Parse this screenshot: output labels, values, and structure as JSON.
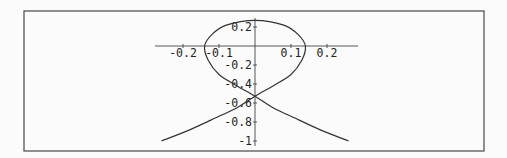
{
  "chart_data": {
    "type": "line",
    "title": "",
    "xlabel": "",
    "ylabel": "",
    "xlim": [
      -0.28,
      0.28
    ],
    "ylim": [
      -1.02,
      0.28
    ],
    "grid": false,
    "legend": null,
    "x_ticks": [
      "-0.2",
      "-0.1",
      "0.1",
      "0.2"
    ],
    "y_ticks": [
      "0.2",
      "-0.2",
      "-0.4",
      "-0.6",
      "-0.8",
      "-1"
    ],
    "series": [
      {
        "name": "curve",
        "points": [
          [
            -0.26,
            -1.0
          ],
          [
            -0.18,
            -0.88
          ],
          [
            -0.1,
            -0.74
          ],
          [
            -0.05,
            -0.65
          ],
          [
            0.0,
            -0.53
          ],
          [
            0.05,
            -0.42
          ],
          [
            0.1,
            -0.3
          ],
          [
            0.13,
            -0.15
          ],
          [
            0.14,
            0.0
          ],
          [
            0.12,
            0.12
          ],
          [
            0.08,
            0.22
          ],
          [
            0.0,
            0.27
          ],
          [
            -0.08,
            0.22
          ],
          [
            -0.12,
            0.12
          ],
          [
            -0.14,
            0.0
          ],
          [
            -0.13,
            -0.15
          ],
          [
            -0.1,
            -0.3
          ],
          [
            -0.05,
            -0.42
          ],
          [
            0.0,
            -0.53
          ],
          [
            0.05,
            -0.65
          ],
          [
            0.1,
            -0.74
          ],
          [
            0.18,
            -0.88
          ],
          [
            0.26,
            -1.0
          ]
        ]
      }
    ]
  }
}
